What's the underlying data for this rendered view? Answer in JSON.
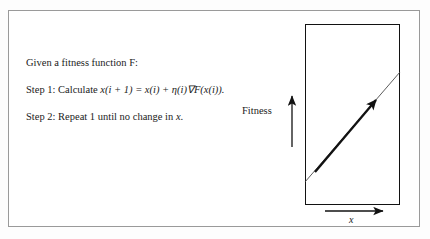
{
  "figure": {
    "background_color": "#ffffff",
    "frame_color": "#9a9a9a",
    "ink_color": "#121212"
  },
  "algorithm": {
    "intro": "Given a fitness function F:",
    "step1_prefix": "Step 1: Calculate ",
    "step1_formula": "x(i + 1) = x(i) + η(i)∇F(x(i)).",
    "step1_full": "Step 1: Calculate x(i + 1) = x(i) + η(i)∇F(x(i)).",
    "step2_prefix": "Step 2: Repeat 1 until no change in ",
    "step2_variable": "x",
    "step2_suffix": ".",
    "step2_full": "Step 2: Repeat 1 until no change in x."
  },
  "diagram": {
    "y_axis_label": "Fitness",
    "x_axis_label": "x",
    "box": {
      "left": 305,
      "top": 24,
      "width": 95,
      "height": 181
    },
    "gradient_line": {
      "from": [
        305,
        182
      ],
      "to": [
        400,
        72
      ]
    },
    "ascent_arrow": {
      "from": [
        315,
        172
      ],
      "to": [
        378,
        97
      ]
    },
    "fitness_arrow": {
      "from": [
        292,
        147
      ],
      "to": [
        292,
        93
      ]
    },
    "x_arrow": {
      "from": [
        325,
        211
      ],
      "to": [
        386,
        211
      ]
    }
  }
}
